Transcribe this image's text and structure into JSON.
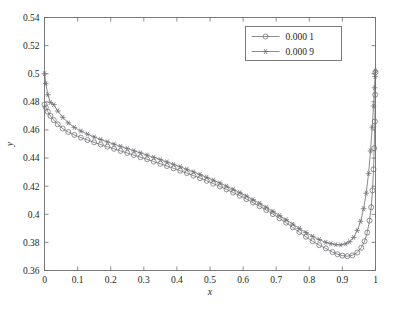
{
  "page": {
    "top_strip_text": " ",
    "caption": " "
  },
  "chart_data": {
    "type": "line",
    "title": "",
    "xlabel": "x",
    "ylabel": "y",
    "xlim": [
      0,
      1
    ],
    "ylim": [
      0.36,
      0.54
    ],
    "grid": false,
    "legend_position": "top-right",
    "xticks": [
      0,
      0.1,
      0.2,
      0.3,
      0.4,
      0.5,
      0.6,
      0.7,
      0.8,
      0.9,
      1
    ],
    "xticklabels": [
      "0",
      "0.1",
      "0.2",
      "0.3",
      "0.4",
      "0.5",
      "0.6",
      "0.7",
      "0.8",
      "0.9",
      "1"
    ],
    "yticks": [
      0.36,
      0.38,
      0.4,
      0.42,
      0.44,
      0.46,
      0.48,
      0.5,
      0.52,
      0.54
    ],
    "yticklabels": [
      "0.36",
      "0.38",
      "0.4",
      "0.42",
      "0.44",
      "0.46",
      "0.48",
      "0.5",
      "0.52",
      "0.54"
    ],
    "series": [
      {
        "name": "0.000 1",
        "marker": "circle",
        "color": "#6e6e72",
        "x": [
          0.0,
          0.004,
          0.01,
          0.018,
          0.028,
          0.04,
          0.055,
          0.072,
          0.09,
          0.11,
          0.13,
          0.15,
          0.17,
          0.19,
          0.21,
          0.23,
          0.25,
          0.27,
          0.29,
          0.31,
          0.33,
          0.35,
          0.37,
          0.39,
          0.41,
          0.43,
          0.45,
          0.47,
          0.49,
          0.51,
          0.53,
          0.55,
          0.57,
          0.59,
          0.61,
          0.63,
          0.65,
          0.67,
          0.69,
          0.71,
          0.73,
          0.75,
          0.77,
          0.79,
          0.81,
          0.83,
          0.85,
          0.87,
          0.885,
          0.9,
          0.915,
          0.93,
          0.945,
          0.957,
          0.967,
          0.975,
          0.982,
          0.987,
          0.991,
          0.994,
          0.996,
          0.998,
          0.999,
          1.0
        ],
        "y": [
          0.478,
          0.476,
          0.473,
          0.47,
          0.467,
          0.464,
          0.461,
          0.4585,
          0.4565,
          0.4545,
          0.4528,
          0.4512,
          0.4496,
          0.4481,
          0.4466,
          0.4451,
          0.4436,
          0.4421,
          0.4406,
          0.4391,
          0.4375,
          0.4359,
          0.4343,
          0.4327,
          0.431,
          0.4293,
          0.4275,
          0.4257,
          0.4238,
          0.4218,
          0.4198,
          0.4177,
          0.4155,
          0.4132,
          0.4108,
          0.4083,
          0.4057,
          0.403,
          0.4001,
          0.3971,
          0.394,
          0.3907,
          0.3873,
          0.384,
          0.3808,
          0.378,
          0.3757,
          0.3731,
          0.3716,
          0.3706,
          0.3702,
          0.3708,
          0.3728,
          0.3762,
          0.3808,
          0.387,
          0.3955,
          0.405,
          0.417,
          0.432,
          0.447,
          0.466,
          0.485,
          0.501
        ]
      },
      {
        "name": "0.000 9",
        "marker": "star",
        "color": "#6e6e72",
        "x": [
          0.0,
          0.004,
          0.01,
          0.018,
          0.028,
          0.04,
          0.055,
          0.072,
          0.09,
          0.11,
          0.13,
          0.15,
          0.17,
          0.19,
          0.21,
          0.23,
          0.25,
          0.27,
          0.29,
          0.31,
          0.33,
          0.35,
          0.37,
          0.39,
          0.41,
          0.43,
          0.45,
          0.47,
          0.49,
          0.51,
          0.53,
          0.55,
          0.57,
          0.59,
          0.61,
          0.63,
          0.65,
          0.67,
          0.69,
          0.71,
          0.73,
          0.75,
          0.77,
          0.79,
          0.81,
          0.83,
          0.85,
          0.865,
          0.88,
          0.895,
          0.91,
          0.922,
          0.934,
          0.945,
          0.955,
          0.964,
          0.972,
          0.979,
          0.985,
          0.99,
          0.994,
          0.997,
          0.999,
          1.0
        ],
        "y": [
          0.5,
          0.493,
          0.485,
          0.4795,
          0.478,
          0.4735,
          0.469,
          0.465,
          0.4618,
          0.4592,
          0.457,
          0.455,
          0.4532,
          0.4515,
          0.4499,
          0.4483,
          0.4468,
          0.4452,
          0.4437,
          0.4421,
          0.4405,
          0.4389,
          0.4372,
          0.4355,
          0.4338,
          0.432,
          0.4302,
          0.4283,
          0.4263,
          0.4243,
          0.4222,
          0.42,
          0.4178,
          0.4154,
          0.413,
          0.4104,
          0.4078,
          0.405,
          0.4021,
          0.3991,
          0.3961,
          0.393,
          0.3899,
          0.387,
          0.3843,
          0.382,
          0.38,
          0.3791,
          0.3784,
          0.3782,
          0.379,
          0.3805,
          0.3835,
          0.3885,
          0.395,
          0.404,
          0.415,
          0.429,
          0.445,
          0.462,
          0.477,
          0.49,
          0.498,
          0.502
        ]
      }
    ]
  }
}
